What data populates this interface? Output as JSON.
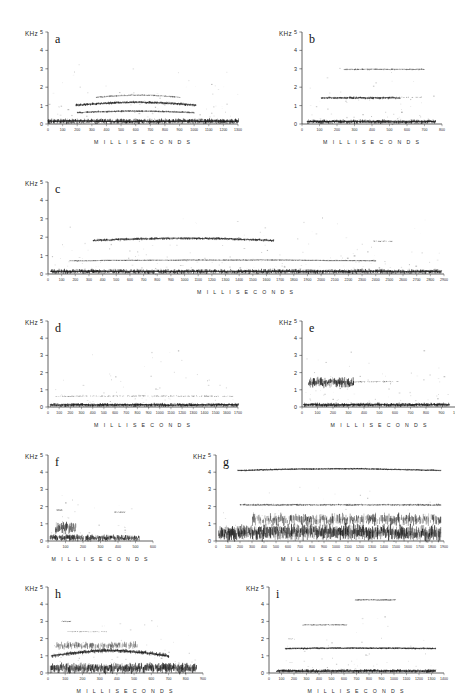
{
  "figure": {
    "title_visible": false,
    "background": "#ffffff",
    "ink": "#1a1a1a",
    "panel_count": 9
  },
  "axis_defaults": {
    "y_unit_label": "KHz",
    "y_ticks": [
      0,
      1,
      2,
      3,
      4,
      5
    ],
    "y_range": [
      0,
      5
    ],
    "x_title": "M I L L I S E C O N D S",
    "x_tick_step": 100
  },
  "chart_data": [
    {
      "id": "a",
      "type": "heatmap",
      "title": "a",
      "xlabel": "M I L L I S E C O N D S",
      "ylabel": "KHz",
      "xlim": [
        0,
        1300
      ],
      "ylim": [
        0,
        5
      ],
      "xticks": [
        0,
        100,
        200,
        300,
        400,
        500,
        600,
        700,
        800,
        900,
        1000,
        1100,
        1200,
        1300
      ],
      "yticks": [
        0,
        1,
        2,
        3,
        4,
        5
      ],
      "grid": false,
      "signal_start_ms": 0,
      "signal_end_ms": 1300,
      "bands": [
        {
          "name": "fundamental-broadband",
          "center_khz": 0.15,
          "thickness_khz": 0.22,
          "density": 0.95,
          "from_ms": 0,
          "to_ms": 1300,
          "arch_khz": 0.0
        },
        {
          "name": "harmonic-1",
          "center_khz": 0.62,
          "thickness_khz": 0.09,
          "density": 0.7,
          "from_ms": 200,
          "to_ms": 1000,
          "arch_khz": 0.08
        },
        {
          "name": "harmonic-2",
          "center_khz": 1.02,
          "thickness_khz": 0.12,
          "density": 0.9,
          "from_ms": 190,
          "to_ms": 1010,
          "arch_khz": 0.16
        },
        {
          "name": "harmonic-3",
          "center_khz": 1.45,
          "thickness_khz": 0.07,
          "density": 0.45,
          "from_ms": 330,
          "to_ms": 900,
          "arch_khz": 0.12
        }
      ]
    },
    {
      "id": "b",
      "type": "heatmap",
      "title": "b",
      "xlabel": "M I L L I S E C O N D S",
      "ylabel": "KHz",
      "xlim": [
        0,
        800
      ],
      "ylim": [
        0,
        5
      ],
      "xticks": [
        0,
        100,
        200,
        300,
        400,
        500,
        600,
        700,
        800
      ],
      "yticks": [
        0,
        1,
        2,
        3,
        4,
        5
      ],
      "grid": false,
      "signal_start_ms": 30,
      "signal_end_ms": 760,
      "bands": [
        {
          "name": "fundamental-broadband",
          "center_khz": 0.13,
          "thickness_khz": 0.18,
          "density": 0.95,
          "from_ms": 30,
          "to_ms": 760,
          "arch_khz": 0.0
        },
        {
          "name": "harmonic-1",
          "center_khz": 1.42,
          "thickness_khz": 0.11,
          "density": 0.8,
          "from_ms": 110,
          "to_ms": 560,
          "arch_khz": 0.0
        },
        {
          "name": "harmonic-1-tail",
          "center_khz": 1.45,
          "thickness_khz": 0.05,
          "density": 0.3,
          "from_ms": 420,
          "to_ms": 700,
          "arch_khz": 0.0
        },
        {
          "name": "harmonic-2",
          "center_khz": 2.97,
          "thickness_khz": 0.07,
          "density": 0.5,
          "from_ms": 240,
          "to_ms": 700,
          "arch_khz": 0.0
        }
      ]
    },
    {
      "id": "c",
      "type": "heatmap",
      "title": "c",
      "xlabel": "M I L L I S E C O N D S",
      "ylabel": "KHz",
      "xlim": [
        0,
        2900
      ],
      "ylim": [
        0,
        5
      ],
      "xticks": [
        0,
        100,
        200,
        300,
        400,
        500,
        600,
        700,
        800,
        900,
        1000,
        1100,
        1200,
        1300,
        1400,
        1500,
        1600,
        1700,
        1800,
        1900,
        2000,
        2100,
        2200,
        2300,
        2400,
        2500,
        2600,
        2700,
        2800,
        2900
      ],
      "yticks": [
        0,
        1,
        2,
        3,
        4,
        5
      ],
      "grid": false,
      "signal_start_ms": 20,
      "signal_end_ms": 2880,
      "bands": [
        {
          "name": "fundamental-broadband",
          "center_khz": 0.14,
          "thickness_khz": 0.2,
          "density": 0.9,
          "from_ms": 20,
          "to_ms": 2880,
          "arch_khz": 0.0
        },
        {
          "name": "harmonic-1",
          "center_khz": 0.72,
          "thickness_khz": 0.05,
          "density": 0.55,
          "from_ms": 160,
          "to_ms": 2400,
          "arch_khz": 0.04
        },
        {
          "name": "harmonic-2",
          "center_khz": 1.82,
          "thickness_khz": 0.12,
          "density": 0.85,
          "from_ms": 330,
          "to_ms": 1650,
          "arch_khz": 0.12
        },
        {
          "name": "harmonic-2-fragment",
          "center_khz": 1.78,
          "thickness_khz": 0.06,
          "density": 0.4,
          "from_ms": 2380,
          "to_ms": 2520,
          "arch_khz": 0.0
        }
      ]
    },
    {
      "id": "d",
      "type": "heatmap",
      "title": "d",
      "xlabel": "M I L L I S E C O N D S",
      "ylabel": "KHz",
      "xlim": [
        0,
        1700
      ],
      "ylim": [
        0,
        5
      ],
      "xticks": [
        0,
        100,
        200,
        300,
        400,
        500,
        600,
        700,
        800,
        900,
        1000,
        1100,
        1200,
        1300,
        1400,
        1500,
        1600,
        1700
      ],
      "yticks": [
        0,
        1,
        2,
        3,
        4,
        5
      ],
      "grid": false,
      "signal_start_ms": 20,
      "signal_end_ms": 1700,
      "bands": [
        {
          "name": "fundamental-broadband",
          "center_khz": 0.12,
          "thickness_khz": 0.17,
          "density": 0.9,
          "from_ms": 20,
          "to_ms": 1700,
          "arch_khz": 0.0
        },
        {
          "name": "harmonic-1",
          "center_khz": 0.62,
          "thickness_khz": 0.06,
          "density": 0.4,
          "from_ms": 60,
          "to_ms": 1650,
          "arch_khz": 0.02
        }
      ]
    },
    {
      "id": "e",
      "type": "heatmap",
      "title": "e",
      "xlabel": "M I L L I S E C O N D S",
      "ylabel": "KHz",
      "xlim": [
        0,
        1000
      ],
      "ylim": [
        0,
        5
      ],
      "xticks": [
        0,
        100,
        200,
        300,
        400,
        500,
        600,
        700,
        800,
        900,
        1000
      ],
      "yticks": [
        0,
        1,
        2,
        3,
        4,
        5
      ],
      "grid": false,
      "signal_start_ms": 10,
      "signal_end_ms": 950,
      "bands": [
        {
          "name": "fundamental-broadband",
          "center_khz": 0.13,
          "thickness_khz": 0.18,
          "density": 0.92,
          "from_ms": 10,
          "to_ms": 950,
          "arch_khz": 0.0
        },
        {
          "name": "noise-blob",
          "center_khz": 1.42,
          "thickness_khz": 0.45,
          "density": 0.95,
          "from_ms": 40,
          "to_ms": 330,
          "arch_khz": 0.0
        },
        {
          "name": "harmonic-tail",
          "center_khz": 1.47,
          "thickness_khz": 0.07,
          "density": 0.35,
          "from_ms": 330,
          "to_ms": 620,
          "arch_khz": 0.0
        }
      ]
    },
    {
      "id": "f",
      "type": "heatmap",
      "title": "f",
      "xlabel": "M I L L I S E C O N D S",
      "ylabel": "KHz",
      "xlim": [
        0,
        600
      ],
      "ylim": [
        0,
        5
      ],
      "xticks": [
        0,
        100,
        200,
        300,
        400,
        500,
        600
      ],
      "yticks": [
        0,
        1,
        2,
        3,
        4,
        5
      ],
      "grid": false,
      "signal_start_ms": 10,
      "signal_end_ms": 520,
      "bands": [
        {
          "name": "fundamental-broadband",
          "center_khz": 0.18,
          "thickness_khz": 0.3,
          "density": 0.95,
          "from_ms": 10,
          "to_ms": 520,
          "arch_khz": 0.0
        },
        {
          "name": "onset-burst",
          "center_khz": 0.75,
          "thickness_khz": 0.55,
          "density": 0.8,
          "from_ms": 40,
          "to_ms": 160,
          "arch_khz": 0.0
        },
        {
          "name": "fragment-high",
          "center_khz": 1.8,
          "thickness_khz": 0.05,
          "density": 0.45,
          "from_ms": 50,
          "to_ms": 80,
          "arch_khz": 0.0
        },
        {
          "name": "fragment-high-2",
          "center_khz": 1.68,
          "thickness_khz": 0.05,
          "density": 0.45,
          "from_ms": 380,
          "to_ms": 440,
          "arch_khz": 0.0
        }
      ]
    },
    {
      "id": "g",
      "type": "heatmap",
      "title": "g",
      "xlabel": "M I L L I S E C O N D S",
      "ylabel": "KHz",
      "xlim": [
        0,
        1900
      ],
      "ylim": [
        0,
        5
      ],
      "xticks": [
        0,
        100,
        200,
        300,
        400,
        500,
        600,
        700,
        800,
        900,
        1000,
        1100,
        1200,
        1300,
        1400,
        1500,
        1600,
        1700,
        1800,
        1900
      ],
      "yticks": [
        0,
        1,
        2,
        3,
        4,
        5
      ],
      "grid": false,
      "signal_start_ms": 20,
      "signal_end_ms": 1870,
      "bands": [
        {
          "name": "fundamental-broadband",
          "center_khz": 0.42,
          "thickness_khz": 0.72,
          "density": 0.98,
          "from_ms": 20,
          "to_ms": 1870,
          "arch_khz": 0.12
        },
        {
          "name": "mid-noise",
          "center_khz": 1.25,
          "thickness_khz": 0.55,
          "density": 0.6,
          "from_ms": 300,
          "to_ms": 1870,
          "arch_khz": 0.0
        },
        {
          "name": "harmonic-2khz",
          "center_khz": 2.1,
          "thickness_khz": 0.1,
          "density": 0.55,
          "from_ms": 200,
          "to_ms": 1870,
          "arch_khz": 0.0
        },
        {
          "name": "harmonic-4khz",
          "center_khz": 4.1,
          "thickness_khz": 0.08,
          "density": 0.9,
          "from_ms": 180,
          "to_ms": 1870,
          "arch_khz": 0.1
        }
      ]
    },
    {
      "id": "h",
      "type": "heatmap",
      "title": "h",
      "xlabel": "M I L L I S E C O N D S",
      "ylabel": "KHz",
      "xlim": [
        0,
        900
      ],
      "ylim": [
        0,
        5
      ],
      "xticks": [
        0,
        100,
        200,
        300,
        400,
        500,
        600,
        700,
        800,
        900
      ],
      "yticks": [
        0,
        1,
        2,
        3,
        4,
        5
      ],
      "grid": false,
      "signal_start_ms": 10,
      "signal_end_ms": 860,
      "bands": [
        {
          "name": "fundamental-broadband",
          "center_khz": 0.28,
          "thickness_khz": 0.48,
          "density": 0.97,
          "from_ms": 10,
          "to_ms": 860,
          "arch_khz": 0.0
        },
        {
          "name": "rising-harmonic",
          "center_khz": 1.0,
          "thickness_khz": 0.2,
          "density": 0.85,
          "from_ms": 20,
          "to_ms": 700,
          "arch_khz": 0.3
        },
        {
          "name": "upper-noise",
          "center_khz": 1.6,
          "thickness_khz": 0.35,
          "density": 0.5,
          "from_ms": 40,
          "to_ms": 520,
          "arch_khz": 0.0
        },
        {
          "name": "fragment-3khz",
          "center_khz": 3.0,
          "thickness_khz": 0.05,
          "density": 0.5,
          "from_ms": 80,
          "to_ms": 130,
          "arch_khz": 0.0
        },
        {
          "name": "fragment-2_4khz",
          "center_khz": 2.4,
          "thickness_khz": 0.05,
          "density": 0.4,
          "from_ms": 110,
          "to_ms": 340,
          "arch_khz": 0.0
        }
      ]
    },
    {
      "id": "i",
      "type": "heatmap",
      "title": "i",
      "xlabel": "M I L L I S E C O N D S",
      "ylabel": "KHz",
      "xlim": [
        0,
        1400
      ],
      "ylim": [
        0,
        5
      ],
      "xticks": [
        0,
        100,
        200,
        300,
        400,
        500,
        600,
        700,
        800,
        900,
        1000,
        1100,
        1200,
        1300,
        1400
      ],
      "yticks": [
        0,
        1,
        2,
        3,
        4,
        5
      ],
      "grid": false,
      "signal_start_ms": 60,
      "signal_end_ms": 1330,
      "bands": [
        {
          "name": "fundamental-broadband",
          "center_khz": 0.12,
          "thickness_khz": 0.16,
          "density": 0.95,
          "from_ms": 60,
          "to_ms": 1330,
          "arch_khz": 0.0
        },
        {
          "name": "harmonic-1_4khz",
          "center_khz": 1.42,
          "thickness_khz": 0.09,
          "density": 0.95,
          "from_ms": 130,
          "to_ms": 1330,
          "arch_khz": 0.03
        },
        {
          "name": "fragment-2khz",
          "center_khz": 1.98,
          "thickness_khz": 0.05,
          "density": 0.4,
          "from_ms": 140,
          "to_ms": 200,
          "arch_khz": 0.0
        },
        {
          "name": "fragment-2_8khz",
          "center_khz": 2.8,
          "thickness_khz": 0.06,
          "density": 0.45,
          "from_ms": 270,
          "to_ms": 620,
          "arch_khz": 0.0
        },
        {
          "name": "fragment-4_2khz",
          "center_khz": 4.25,
          "thickness_khz": 0.07,
          "density": 0.6,
          "from_ms": 690,
          "to_ms": 1010,
          "arch_khz": 0.0
        }
      ]
    }
  ],
  "panel_layout": [
    {
      "id": "a",
      "left": 22,
      "top": 18,
      "plot_w": 190,
      "plot_h": 92
    },
    {
      "id": "b",
      "left": 276,
      "top": 18,
      "plot_w": 140,
      "plot_h": 92
    },
    {
      "id": "c",
      "left": 22,
      "top": 168,
      "plot_w": 396,
      "plot_h": 92
    },
    {
      "id": "d",
      "left": 22,
      "top": 307,
      "plot_w": 190,
      "plot_h": 86
    },
    {
      "id": "e",
      "left": 276,
      "top": 307,
      "plot_w": 155,
      "plot_h": 86
    },
    {
      "id": "f",
      "left": 22,
      "top": 441,
      "plot_w": 105,
      "plot_h": 86
    },
    {
      "id": "g",
      "left": 190,
      "top": 441,
      "plot_w": 228,
      "plot_h": 86
    },
    {
      "id": "h",
      "left": 22,
      "top": 573,
      "plot_w": 155,
      "plot_h": 86
    },
    {
      "id": "i",
      "left": 243,
      "top": 573,
      "plot_w": 175,
      "plot_h": 86
    }
  ]
}
